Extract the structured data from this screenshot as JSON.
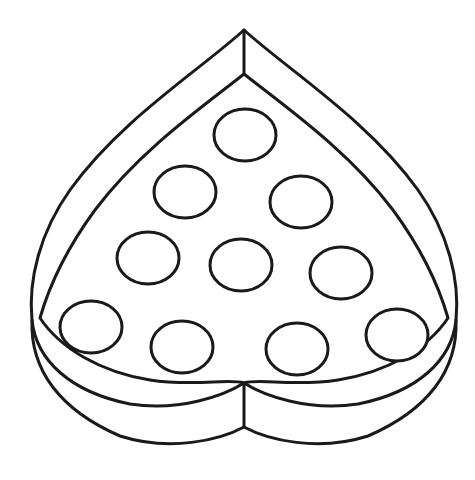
{
  "figure": {
    "stroke_color": "#1a1a1a",
    "background_color": "#ffffff",
    "stroke_width": 3
  },
  "heart_box": {
    "outer_top_point": [
      244,
      30
    ],
    "inner_top_point": [
      244,
      74
    ],
    "inner_bottom_cusp": [
      244,
      383
    ],
    "outer_bottom_cusp": [
      244,
      427
    ],
    "left_edge_x": 30,
    "right_edge_x": 456
  },
  "circles": [
    {
      "cx": 245,
      "cy": 135,
      "rx": 31,
      "ry": 26
    },
    {
      "cx": 185,
      "cy": 192,
      "rx": 31,
      "ry": 26
    },
    {
      "cx": 301,
      "cy": 202,
      "rx": 31,
      "ry": 26
    },
    {
      "cx": 148,
      "cy": 258,
      "rx": 31,
      "ry": 26
    },
    {
      "cx": 241,
      "cy": 265,
      "rx": 31,
      "ry": 26
    },
    {
      "cx": 341,
      "cy": 273,
      "rx": 31,
      "ry": 26
    },
    {
      "cx": 91,
      "cy": 327,
      "rx": 31,
      "ry": 26
    },
    {
      "cx": 182,
      "cy": 347,
      "rx": 31,
      "ry": 26
    },
    {
      "cx": 297,
      "cy": 349,
      "rx": 31,
      "ry": 26
    },
    {
      "cx": 397,
      "cy": 335,
      "rx": 31,
      "ry": 26
    }
  ]
}
